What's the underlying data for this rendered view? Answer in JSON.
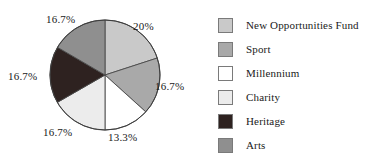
{
  "chart_data": {
    "type": "pie",
    "title": "",
    "categories": [
      "New Opportunities Fund",
      "Sport",
      "Millennium",
      "Charity",
      "Heritage",
      "Arts"
    ],
    "values": [
      20,
      16.7,
      13.3,
      16.7,
      16.7,
      16.7
    ],
    "data_labels": [
      "20%",
      "16.7%",
      "13.3%",
      "16.7%",
      "16.7%",
      "16.7%"
    ],
    "colors": [
      "#c9c9c9",
      "#a9a9a9",
      "#ffffff",
      "#ececec",
      "#2e2220",
      "#8f8f8f"
    ],
    "legend_position": "right",
    "grid": false,
    "start_angle_deg": 0,
    "direction": "clockwise",
    "slices": [
      {
        "label": "New Opportunities Fund",
        "value": 20,
        "data_label": "20%",
        "color": "#c9c9c9",
        "start_deg": 0,
        "end_deg": 72
      },
      {
        "label": "Sport",
        "value": 16.7,
        "data_label": "16.7%",
        "color": "#a9a9a9",
        "start_deg": 72,
        "end_deg": 132.12
      },
      {
        "label": "Millennium",
        "value": 13.3,
        "data_label": "13.3%",
        "color": "#ffffff",
        "start_deg": 132.12,
        "end_deg": 180
      },
      {
        "label": "Charity",
        "value": 16.7,
        "data_label": "16.7%",
        "color": "#ececec",
        "start_deg": 180,
        "end_deg": 240.12
      },
      {
        "label": "Heritage",
        "value": 16.7,
        "data_label": "16.7%",
        "color": "#2e2220",
        "start_deg": 240.12,
        "end_deg": 300.24
      },
      {
        "label": "Arts",
        "value": 16.7,
        "data_label": "16.7%",
        "color": "#8f8f8f",
        "start_deg": 300.24,
        "end_deg": 360
      }
    ]
  },
  "labels": {
    "top_right": "20%",
    "right": "16.7%",
    "bottom_right": "13.3%",
    "bottom_left": "16.7%",
    "left": "16.7%",
    "top_left": "16.7%"
  },
  "legend": {
    "items": [
      {
        "label": "New Opportunities Fund",
        "color": "#c9c9c9"
      },
      {
        "label": "Sport",
        "color": "#a9a9a9"
      },
      {
        "label": "Millennium",
        "color": "#ffffff"
      },
      {
        "label": "Charity",
        "color": "#ececec"
      },
      {
        "label": "Heritage",
        "color": "#2e2220"
      },
      {
        "label": "Arts",
        "color": "#8f8f8f"
      }
    ]
  }
}
